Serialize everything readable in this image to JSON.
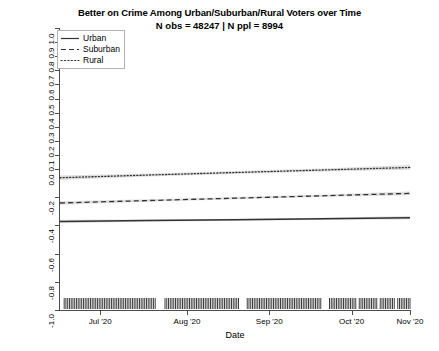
{
  "chart_data": {
    "type": "line",
    "title": "Better on Crime Among Urban/Suburban/Rural Voters over Time",
    "subtitle": "N obs = 48247 | N ppl = 8994",
    "xlabel": "Date",
    "ylabel": "Better on Crime (Trump − Biden)",
    "ylim": [
      -1.0,
      1.0
    ],
    "yticks": [
      1.0,
      0.9,
      0.8,
      0.7,
      0.6,
      0.5,
      0.4,
      0.3,
      0.2,
      0.1,
      0.0,
      -0.2,
      -0.4,
      -0.6,
      -0.8,
      -1.0
    ],
    "ytick_labels": [
      "1.0",
      "0.9",
      "0.8",
      "0.7",
      "0.6",
      "0.5",
      "0.4",
      "0.3",
      "0.2",
      "0.1",
      "0.0",
      "-0.2",
      "-0.4",
      "-0.6",
      "-0.8",
      "-1.0"
    ],
    "xtick_labels": [
      "Jul '20",
      "Aug '20",
      "Sep '20",
      "Oct '20",
      "Nov '20"
    ],
    "xtick_fracs": [
      0.115,
      0.363,
      0.598,
      0.833,
      1.0
    ],
    "grid": false,
    "legend_position": "top-left",
    "legend_title": "",
    "x_start_label": "Jun '20",
    "x_end_label": "Nov '20",
    "series": [
      {
        "name": "Urban",
        "linestyle": "solid",
        "color": "#333333",
        "x": [
          0.0,
          0.25,
          0.5,
          0.75,
          1.0
        ],
        "values": [
          -0.372,
          -0.366,
          -0.36,
          -0.353,
          -0.346
        ],
        "band_halfwidth": [
          0.012,
          0.008,
          0.007,
          0.008,
          0.013
        ]
      },
      {
        "name": "Suburban",
        "linestyle": "dashed",
        "color": "#333333",
        "x": [
          0.0,
          0.25,
          0.5,
          0.75,
          1.0
        ],
        "values": [
          -0.241,
          -0.224,
          -0.207,
          -0.19,
          -0.173
        ],
        "band_halfwidth": [
          0.013,
          0.009,
          0.008,
          0.009,
          0.014
        ]
      },
      {
        "name": "Rural",
        "linestyle": "dotted",
        "color": "#333333",
        "x": [
          0.0,
          0.25,
          0.5,
          0.75,
          1.0
        ],
        "values": [
          -0.062,
          -0.043,
          -0.025,
          -0.007,
          0.011
        ],
        "band_halfwidth": [
          0.016,
          0.011,
          0.01,
          0.011,
          0.017
        ]
      }
    ],
    "rug": {
      "description": "dense observation tick marks along the bottom axis",
      "clusters": [
        [
          0.012,
          0.275
        ],
        [
          0.3,
          0.51
        ],
        [
          0.535,
          0.745
        ],
        [
          0.77,
          0.845
        ],
        [
          0.855,
          0.905
        ],
        [
          0.915,
          0.955
        ],
        [
          0.965,
          1.0
        ]
      ]
    }
  }
}
